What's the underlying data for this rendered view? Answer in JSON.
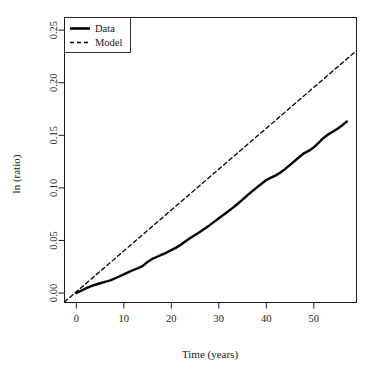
{
  "chart_data": {
    "type": "line",
    "title": "",
    "xlabel": "Time (years)",
    "ylabel": "ln (ratio)",
    "xlim": [
      -2.5,
      59
    ],
    "ylim": [
      -0.009,
      0.262
    ],
    "xticks": [
      0,
      10,
      20,
      30,
      40,
      50
    ],
    "xtick_labels": [
      "0",
      "10",
      "20",
      "30",
      "40",
      "50"
    ],
    "yticks": [
      0.0,
      0.05,
      0.1,
      0.15,
      0.2,
      0.25
    ],
    "ytick_labels": [
      "0.00",
      "0.05",
      "0.10",
      "0.15",
      "0.20",
      "0.25"
    ],
    "grid": false,
    "legend_position": "top-left",
    "series": [
      {
        "name": "Data",
        "style": "solid",
        "color": "#000000",
        "linewidth": 2.4,
        "x": [
          0,
          1,
          2,
          3,
          4,
          5,
          6,
          7,
          8,
          9,
          10,
          11,
          12,
          13,
          14,
          15,
          16,
          17,
          18,
          19,
          20,
          21,
          22,
          23,
          24,
          25,
          26,
          27,
          28,
          29,
          30,
          31,
          32,
          33,
          34,
          35,
          36,
          37,
          38,
          39,
          40,
          41,
          42,
          43,
          44,
          45,
          46,
          47,
          48,
          49,
          50,
          51,
          52,
          53,
          54,
          55,
          56,
          57
        ],
        "y": [
          0.0,
          0.0022,
          0.0044,
          0.0063,
          0.0079,
          0.0093,
          0.0106,
          0.0118,
          0.0136,
          0.0157,
          0.0178,
          0.0199,
          0.0219,
          0.0236,
          0.0258,
          0.0296,
          0.0325,
          0.0345,
          0.0365,
          0.0385,
          0.0408,
          0.0432,
          0.0459,
          0.0492,
          0.0523,
          0.0552,
          0.0581,
          0.0611,
          0.0643,
          0.0677,
          0.0711,
          0.0745,
          0.0778,
          0.0812,
          0.0849,
          0.0889,
          0.0929,
          0.0967,
          0.1003,
          0.1039,
          0.1075,
          0.1098,
          0.1119,
          0.1146,
          0.1181,
          0.1218,
          0.1256,
          0.1296,
          0.1331,
          0.1354,
          0.1385,
          0.1428,
          0.1472,
          0.1507,
          0.1534,
          0.1562,
          0.1596,
          0.1632
        ]
      },
      {
        "name": "Model",
        "style": "dashed",
        "color": "#000000",
        "linewidth": 1.3,
        "x": [
          -2.5,
          59
        ],
        "y": [
          -0.0085,
          0.2305
        ]
      }
    ],
    "data_tail": {
      "comment_free_x": [
        58,
        59,
        60,
        61,
        62,
        63,
        64,
        65,
        66,
        67,
        68,
        69,
        70,
        71,
        72,
        73,
        74,
        75,
        76,
        77,
        78,
        79,
        80,
        81,
        82,
        83,
        84,
        85,
        86,
        87,
        88,
        89,
        90,
        91,
        92,
        93,
        94,
        95,
        96,
        97,
        98,
        99,
        100
      ],
      "unused": true
    }
  },
  "legend": {
    "entries": [
      {
        "label": "Data",
        "style": "solid"
      },
      {
        "label": "Model",
        "style": "dashed"
      }
    ]
  },
  "axes": {
    "x_title": "Time (years)",
    "y_title": "ln (ratio)"
  }
}
